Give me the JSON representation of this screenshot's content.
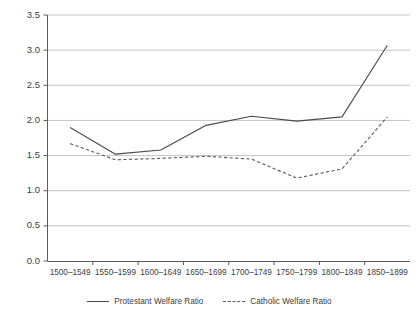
{
  "chart_data": {
    "type": "line",
    "title": "",
    "xlabel": "",
    "ylabel": "",
    "categories": [
      "1500–1549",
      "1550–1599",
      "1600–1649",
      "1650–1699",
      "1700–1749",
      "1750–1799",
      "1800–1849",
      "1850–1899"
    ],
    "series": [
      {
        "name": "Protestant Welfare Ratio",
        "style": "solid",
        "color": "#4a4a4a",
        "values": [
          1.9,
          1.52,
          1.58,
          1.93,
          2.06,
          1.99,
          2.05,
          3.07
        ]
      },
      {
        "name": "Catholic Welfare Ratio",
        "style": "dashed",
        "color": "#5a5a5a",
        "values": [
          1.67,
          1.44,
          1.46,
          1.49,
          1.45,
          1.18,
          1.31,
          2.05
        ]
      }
    ],
    "ylim": [
      0.0,
      3.5
    ],
    "ytick_labels": [
      "0.0",
      "0.5",
      "1.0",
      "1.5",
      "2.0",
      "2.5",
      "3.0",
      "3.5"
    ],
    "ytick_values": [
      0.0,
      0.5,
      1.0,
      1.5,
      2.0,
      2.5,
      3.0,
      3.5
    ],
    "grid": true,
    "grid_axis": "y",
    "grid_color": "#b4b4b4",
    "axis_color": "#5a5a5a",
    "legend_position": "bottom-center",
    "background": "#ffffff"
  },
  "legend": {
    "entries": [
      {
        "label": "Protestant Welfare Ratio"
      },
      {
        "label": "Catholic Welfare Ratio"
      }
    ]
  }
}
